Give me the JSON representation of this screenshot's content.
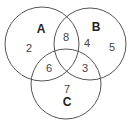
{
  "diagram": {
    "type": "venn",
    "sets": [
      {
        "id": "A",
        "label": "A",
        "cx": 42,
        "cy": 44,
        "r": 37,
        "label_x": 41,
        "label_y": 33
      },
      {
        "id": "B",
        "label": "B",
        "cx": 90,
        "cy": 44,
        "r": 36,
        "label_x": 96,
        "label_y": 31
      },
      {
        "id": "C",
        "label": "C",
        "cx": 66,
        "cy": 84,
        "r": 35,
        "label_x": 67,
        "label_y": 106
      }
    ],
    "regions": [
      {
        "name": "only-a",
        "value": "2",
        "x": 29,
        "y": 52
      },
      {
        "name": "a-and-b",
        "value": "8",
        "x": 66,
        "y": 41
      },
      {
        "name": "only-b-inner",
        "value": "4",
        "x": 87,
        "y": 47
      },
      {
        "name": "only-b-outer",
        "value": "5",
        "x": 112,
        "y": 51
      },
      {
        "name": "a-and-c",
        "value": "6",
        "x": 49,
        "y": 72
      },
      {
        "name": "b-and-c",
        "value": "3",
        "x": 85,
        "y": 72
      },
      {
        "name": "only-c",
        "value": "7",
        "x": 67,
        "y": 93
      }
    ],
    "colors": {
      "stroke": "#555555",
      "label": "#222222",
      "value": "#444444",
      "background": "#ffffff"
    }
  }
}
